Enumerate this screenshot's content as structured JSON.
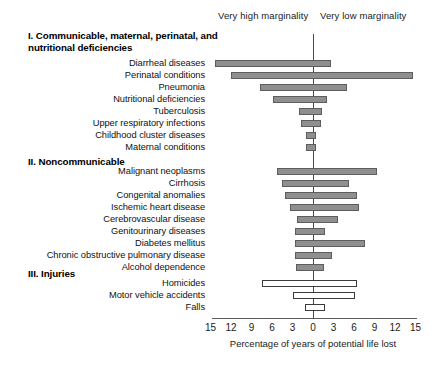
{
  "headers": {
    "high": "Very high marginality",
    "low": "Very low marginality"
  },
  "axis": {
    "title": "Percentage of years of potential life lost",
    "tick_labels": [
      "15",
      "12",
      "9",
      "6",
      "3",
      "0",
      "3",
      "6",
      "9",
      "12",
      "15"
    ],
    "tick_values": [
      -15,
      -12,
      -9,
      -6,
      -3,
      0,
      3,
      6,
      9,
      12,
      15
    ],
    "zero_label": "0"
  },
  "sections": [
    {
      "id": "section-1",
      "label": "I. Communicable, maternal, perinatal, and nutritional deficiencies"
    },
    {
      "id": "section-2",
      "label": "II. Noncommunicable"
    },
    {
      "id": "section-3",
      "label": "III. Injuries"
    }
  ],
  "rows": [
    {
      "label": "Diarrheal diseases",
      "section": 1,
      "style": "filled",
      "left": -14.4,
      "right": 2.7
    },
    {
      "label": "Perinatal conditions",
      "section": 1,
      "style": "filled",
      "left": -12.0,
      "right": 14.7
    },
    {
      "label": "Pneumonia",
      "section": 1,
      "style": "filled",
      "left": -7.7,
      "right": 5.0
    },
    {
      "label": "Nutritional deficiencies",
      "section": 1,
      "style": "filled",
      "left": -5.9,
      "right": 2.1
    },
    {
      "label": "Tuberculosis",
      "section": 1,
      "style": "filled",
      "left": -2.1,
      "right": 1.3
    },
    {
      "label": "Upper respiratory infections",
      "section": 1,
      "style": "filled",
      "left": -1.8,
      "right": 1.2
    },
    {
      "label": "Childhood cluster diseases",
      "section": 1,
      "style": "filled",
      "left": -1.0,
      "right": 0.4
    },
    {
      "label": "Maternal conditions",
      "section": 1,
      "style": "filled",
      "left": -1.0,
      "right": 0.4
    },
    {
      "label": "Malignant neoplasms",
      "section": 2,
      "style": "filled",
      "left": -5.2,
      "right": 9.3
    },
    {
      "label": "Cirrhosis",
      "section": 2,
      "style": "filled",
      "left": -4.6,
      "right": 5.2
    },
    {
      "label": "Congenital anomalies",
      "section": 2,
      "style": "filled",
      "left": -4.1,
      "right": 6.4
    },
    {
      "label": "Ischemic heart disease",
      "section": 2,
      "style": "filled",
      "left": -3.3,
      "right": 6.7
    },
    {
      "label": "Cerebrovascular disease",
      "section": 2,
      "style": "filled",
      "left": -2.4,
      "right": 3.6
    },
    {
      "label": "Genitourinary diseases",
      "section": 2,
      "style": "filled",
      "left": -2.7,
      "right": 1.8
    },
    {
      "label": "Diabetes mellitus",
      "section": 2,
      "style": "filled",
      "left": -2.7,
      "right": 7.6
    },
    {
      "label": "Chronic obstructive pulmonary disease",
      "section": 2,
      "style": "filled",
      "left": -2.7,
      "right": 2.8
    },
    {
      "label": "Alcohol dependence",
      "section": 2,
      "style": "filled",
      "left": -2.5,
      "right": 1.6
    },
    {
      "label": "Homicides",
      "section": 3,
      "style": "hollow",
      "left": -7.4,
      "right": 6.5
    },
    {
      "label": "Motor vehicle accidents",
      "section": 3,
      "style": "hollow",
      "left": -3.0,
      "right": 6.2
    },
    {
      "label": "Falls",
      "section": 3,
      "style": "hollow",
      "left": -1.2,
      "right": 1.8
    }
  ],
  "chart_data": {
    "type": "bar",
    "orientation": "horizontal-diverging",
    "title": "",
    "xlabel": "Percentage of years of potential life lost",
    "ylabel": "",
    "xlim": [
      -15,
      15
    ],
    "xticks": [
      -15,
      -12,
      -9,
      -6,
      -3,
      0,
      3,
      6,
      9,
      12,
      15
    ],
    "xticklabels": [
      "15",
      "12",
      "9",
      "6",
      "3",
      "0",
      "3",
      "6",
      "9",
      "12",
      "15"
    ],
    "grid": false,
    "legend": [
      "Very high marginality",
      "Very low marginality"
    ],
    "legend_position": "top",
    "note": "Left of zero = very high marginality municipalities; right of zero = very low marginality municipalities. Values are percentage of years of potential life lost.",
    "categories": [
      "Diarrheal diseases",
      "Perinatal conditions",
      "Pneumonia",
      "Nutritional deficiencies",
      "Tuberculosis",
      "Upper respiratory infections",
      "Childhood cluster diseases",
      "Maternal conditions",
      "Malignant neoplasms",
      "Cirrhosis",
      "Congenital anomalies",
      "Ischemic heart disease",
      "Cerebrovascular disease",
      "Genitourinary diseases",
      "Diabetes mellitus",
      "Chronic obstructive pulmonary disease",
      "Alcohol dependence",
      "Homicides",
      "Motor vehicle accidents",
      "Falls"
    ],
    "series": [
      {
        "name": "Very high marginality",
        "values": [
          14.4,
          12.0,
          7.7,
          5.9,
          2.1,
          1.8,
          1.0,
          1.0,
          5.2,
          4.6,
          4.1,
          3.3,
          2.4,
          2.7,
          2.7,
          2.7,
          2.5,
          7.4,
          3.0,
          1.2
        ]
      },
      {
        "name": "Very low marginality",
        "values": [
          2.7,
          14.7,
          5.0,
          2.1,
          1.3,
          1.2,
          0.4,
          0.4,
          9.3,
          5.2,
          6.4,
          6.7,
          3.6,
          1.8,
          7.6,
          2.8,
          1.6,
          6.5,
          6.2,
          1.8
        ]
      }
    ],
    "groups": {
      "I. Communicable, maternal, perinatal, and nutritional deficiencies": [
        0,
        1,
        2,
        3,
        4,
        5,
        6,
        7
      ],
      "II. Noncommunicable": [
        8,
        9,
        10,
        11,
        12,
        13,
        14,
        15,
        16
      ],
      "III. Injuries": [
        17,
        18,
        19
      ]
    },
    "colors": {
      "filled_bar": "#8f8f8f",
      "filled_border": "#5d5d5d",
      "hollow_bar": "#ffffff",
      "hollow_border": "#3b3b3b",
      "axis": "#5a5a5a"
    }
  }
}
